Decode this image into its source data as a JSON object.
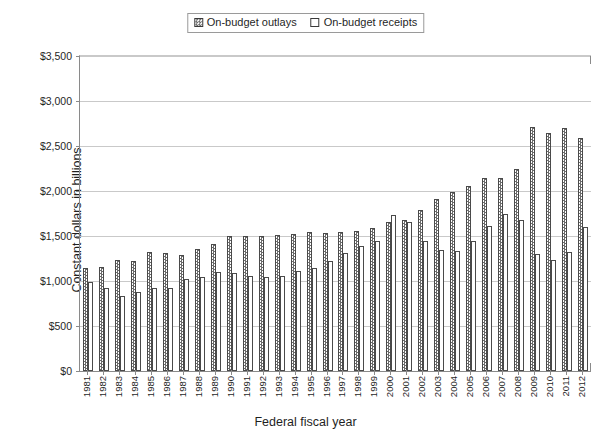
{
  "chart_data": {
    "type": "bar",
    "title": "",
    "xlabel": "Federal fiscal year",
    "ylabel": "Constant dollars in billions",
    "ylim": [
      0,
      3500
    ],
    "ytick_values": [
      0,
      500,
      1000,
      1500,
      2000,
      2500,
      3000,
      3500
    ],
    "ytick_labels": [
      "$0",
      "$500",
      "$1,000",
      "$1,500",
      "$2,000",
      "$2,500",
      "$3,000",
      "$3,500"
    ],
    "grid": "horizontal",
    "legend_position": "top-center",
    "categories": [
      "1981",
      "1982",
      "1983",
      "1984",
      "1985",
      "1986",
      "1987",
      "1988",
      "1989",
      "1990",
      "1991",
      "1992",
      "1993",
      "1994",
      "1995",
      "1996",
      "1997",
      "1998",
      "1999",
      "2000",
      "2001",
      "2002",
      "2003",
      "2004",
      "2005",
      "2006",
      "2007",
      "2008",
      "2009",
      "2010",
      "2011",
      "2012"
    ],
    "series": [
      {
        "name": "On-budget outlays",
        "pattern": "hatched",
        "values": [
          1150,
          1160,
          1230,
          1220,
          1320,
          1310,
          1290,
          1360,
          1410,
          1500,
          1500,
          1500,
          1510,
          1520,
          1540,
          1530,
          1550,
          1560,
          1590,
          1660,
          1680,
          1790,
          1910,
          1990,
          2060,
          2150,
          2150,
          2240,
          2710,
          2650,
          2700,
          2590
        ]
      },
      {
        "name": "On-budget receipts",
        "pattern": "open",
        "values": [
          990,
          920,
          835,
          880,
          920,
          920,
          1020,
          1040,
          1100,
          1090,
          1060,
          1040,
          1060,
          1110,
          1150,
          1220,
          1310,
          1390,
          1450,
          1730,
          1660,
          1450,
          1350,
          1330,
          1450,
          1610,
          1740,
          1680,
          1300,
          1230,
          1320,
          1600
        ]
      }
    ]
  },
  "legend": {
    "items": [
      {
        "label": "On-budget outlays",
        "pattern": "hatched"
      },
      {
        "label": "On-budget receipts",
        "pattern": "open"
      }
    ]
  },
  "colors": {
    "axis": "#8a8a8a",
    "grid": "#c9c9c9",
    "bar_border": "#4a4a4a",
    "hatch": "#6b6b6b",
    "text": "#1f1f1f",
    "background": "#ffffff"
  }
}
